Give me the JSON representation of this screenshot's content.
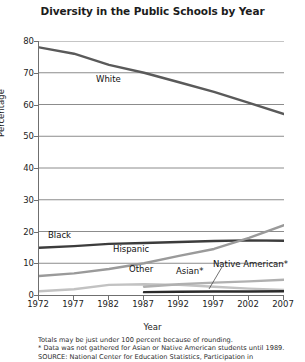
{
  "chart_data": {
    "type": "line",
    "title": "Diversity in the Public Schools by Year",
    "xlabel": "Year",
    "ylabel": "Percentage",
    "xlim": [
      1972,
      2007
    ],
    "ylim": [
      0,
      80
    ],
    "grid": true,
    "legend_position": "inline-labels",
    "x": [
      1972,
      1977,
      1982,
      1987,
      1992,
      1997,
      2002,
      2007
    ],
    "xtick_labels": [
      "1972",
      "1977",
      "1982",
      "1987",
      "1992",
      "1997",
      "2002",
      "2007"
    ],
    "ytick_labels": [
      "0",
      "10",
      "20",
      "30",
      "40",
      "50",
      "60",
      "70",
      "80"
    ],
    "ytick_values": [
      0,
      10,
      20,
      30,
      40,
      50,
      60,
      70,
      80
    ],
    "series": [
      {
        "name": "White",
        "label": "White",
        "color": "#5a5a5a",
        "values": [
          78,
          76,
          72.5,
          70,
          67,
          64,
          60.5,
          57
        ]
      },
      {
        "name": "Black",
        "label": "Black",
        "color": "#3c3c3c",
        "values": [
          14.9,
          15.4,
          16.1,
          16.4,
          16.7,
          17,
          17.2,
          17.1
        ]
      },
      {
        "name": "Hispanic",
        "label": "Hispanic",
        "color": "#9a9a9a",
        "values": [
          6,
          6.8,
          8.2,
          10,
          12.3,
          14.5,
          18,
          22
        ]
      },
      {
        "name": "Other",
        "label": "Other",
        "color": "#c2c2c2",
        "values": [
          1.2,
          1.8,
          3.2,
          3.4,
          3.2,
          2.6,
          2,
          1.6
        ]
      },
      {
        "name": "Asian",
        "label": "Asian*",
        "color": "#b0b0b0",
        "values": [
          null,
          null,
          null,
          2.6,
          3.4,
          3.9,
          4.3,
          4.8
        ]
      },
      {
        "name": "Native American",
        "label": "Native American*",
        "color": "#2a2a2a",
        "values": [
          null,
          null,
          null,
          0.9,
          1.0,
          1.1,
          1.1,
          1.2
        ]
      }
    ],
    "annotations": [
      {
        "text": "White",
        "x_px": 96,
        "y_px": 74
      },
      {
        "text": "Black",
        "x_px": 48,
        "y_px": 230
      },
      {
        "text": "Hispanic",
        "x_px": 113,
        "y_px": 244
      },
      {
        "text": "Other",
        "x_px": 129,
        "y_px": 264
      },
      {
        "text": "Asian*",
        "x_px": 176,
        "y_px": 266
      },
      {
        "text": "Native American*",
        "x_px": 213,
        "y_px": 259
      }
    ]
  },
  "footnotes": [
    "Totals may be just under 100 percent because of rounding.",
    "* Data was not gathered for Asian or Native American students until 1989.",
    "SOURCE: National Center for Education Statistics, Participation in"
  ]
}
